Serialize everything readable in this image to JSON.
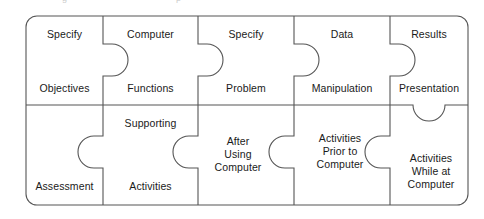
{
  "diagram": {
    "type": "jigsaw-puzzle",
    "rows": 2,
    "columns": 5,
    "stroke_color": "#555555",
    "background_color": "#ffffff",
    "text_color": "#1a1a1a",
    "pieces": [
      {
        "id": "specify-objectives",
        "row": 0,
        "column": 0,
        "upper_label": "Specify",
        "lower_label": "Objectives",
        "knob": "none"
      },
      {
        "id": "computer-functions",
        "row": 0,
        "column": 1,
        "upper_label": "Computer",
        "lower_label": "Functions",
        "knob": "right"
      },
      {
        "id": "specify-problem",
        "row": 0,
        "column": 2,
        "upper_label": "Specify",
        "lower_label": "Problem",
        "knob": "right"
      },
      {
        "id": "data-manipulation",
        "row": 0,
        "column": 3,
        "upper_label": "Data",
        "lower_label": "Manipulation",
        "knob": "right"
      },
      {
        "id": "results-presentation",
        "row": 0,
        "column": 4,
        "upper_label": "Results",
        "lower_label": "Presentation",
        "knob": "right"
      },
      {
        "id": "assessment",
        "row": 1,
        "column": 0,
        "upper_label": "",
        "lower_label": "Assessment",
        "knob": "left"
      },
      {
        "id": "supporting-activities",
        "row": 1,
        "column": 1,
        "upper_label": "Supporting",
        "lower_label": "Activities",
        "knob": "left"
      },
      {
        "id": "after-using-computer",
        "row": 1,
        "column": 2,
        "center_label": "After\nUsing\nComputer",
        "knob": "left"
      },
      {
        "id": "activities-prior-to-computer",
        "row": 1,
        "column": 3,
        "center_label": "Activities\nPrior to\nComputer",
        "knob": "left"
      },
      {
        "id": "activities-while-at-computer",
        "row": 1,
        "column": 4,
        "center_label": "Activities\nWhile at\nComputer",
        "knob": "up"
      }
    ]
  },
  "geometry": {
    "frame_left": 26,
    "frame_right": 468,
    "frame_top": 16,
    "frame_bottom": 205,
    "divider_y": 105,
    "divider_x": [
      103,
      198,
      294,
      390
    ],
    "corner_radius": 11,
    "knob_radius": 16
  }
}
